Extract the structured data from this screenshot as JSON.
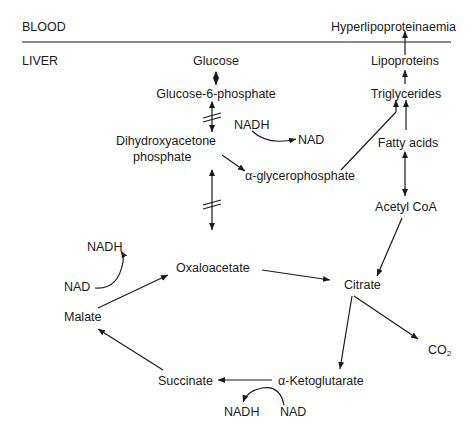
{
  "regions": {
    "blood": "BLOOD",
    "liver": "LIVER"
  },
  "nodes": {
    "hyperlipo": "Hyperlipoproteinaemia",
    "glucose": "Glucose",
    "lipoproteins": "Lipoproteins",
    "g6p": "Glucose-6-phosphate",
    "triglycerides": "Triglycerides",
    "dhap_line1": "Dihydroxyacetone",
    "dhap_line2": "phosphate",
    "nadh_top": "NADH",
    "nad_top": "NAD",
    "alpha_gp": "α-glycerophosphate",
    "fatty_acids": "Fatty acids",
    "acetyl_coa": "Acetyl CoA",
    "nadh_left": "NADH",
    "nad_left": "NAD",
    "oxaloacetate": "Oxaloacetate",
    "citrate": "Citrate",
    "malate": "Malate",
    "co2_main": "CO",
    "co2_sub": "2",
    "succinate": "Succinate",
    "alpha_kg": "α-Ketoglutarate",
    "nadh_bottom": "NADH",
    "nad_bottom": "NAD"
  },
  "colors": {
    "ink": "#1a1a1a",
    "background": "#ffffff"
  }
}
